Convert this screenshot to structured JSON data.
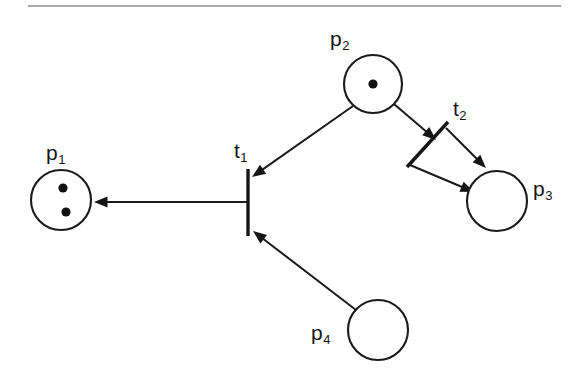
{
  "figure": {
    "width": 577,
    "height": 387,
    "background_color": "#ffffff",
    "ink_color": "#161616",
    "rule_color": "#8e8e8e"
  },
  "top_rule": {
    "name": "top-horizontal-rule",
    "x1": 28,
    "x2": 561,
    "y": 6
  },
  "places": [
    {
      "id": "p1",
      "label_base": "p",
      "label_sub": "1",
      "cx": 61,
      "cy": 200,
      "r": 30,
      "tokens": 2,
      "token_positions": [
        [
          63,
          188
        ],
        [
          66,
          212
        ]
      ],
      "label_x": 46,
      "label_y": 142
    },
    {
      "id": "p2",
      "label_base": "p",
      "label_sub": "2",
      "cx": 373,
      "cy": 84,
      "r": 29,
      "tokens": 1,
      "token_positions": [
        [
          373,
          84
        ]
      ],
      "label_x": 330,
      "label_y": 28
    },
    {
      "id": "p3",
      "label_base": "p",
      "label_sub": "3",
      "cx": 497,
      "cy": 201,
      "r": 30,
      "tokens": 0,
      "token_positions": [],
      "label_x": 533,
      "label_y": 178
    },
    {
      "id": "p4",
      "label_base": "p",
      "label_sub": "4",
      "cx": 378,
      "cy": 330,
      "r": 30,
      "tokens": 0,
      "token_positions": [],
      "label_x": 311,
      "label_y": 322
    }
  ],
  "transitions": [
    {
      "id": "t1",
      "label_base": "t",
      "label_sub": "1",
      "shape": "vertical-bar",
      "x1": 248,
      "y1": 169,
      "x2": 248,
      "y2": 236,
      "label_x": 234,
      "label_y": 140
    },
    {
      "id": "t2",
      "label_base": "t",
      "label_sub": "2",
      "shape": "diagonal-bar",
      "x1": 448,
      "y1": 122,
      "x2": 407,
      "y2": 167,
      "label_x": 453,
      "label_y": 98
    }
  ],
  "arcs": [
    {
      "id": "arc-p2-t1",
      "from": "p2",
      "to": "t1",
      "x1": 353,
      "y1": 106,
      "x2": 252,
      "y2": 177,
      "arrowhead": "end"
    },
    {
      "id": "arc-t1-p1",
      "from": "t1",
      "to": "p1",
      "x1": 247,
      "y1": 202,
      "x2": 94,
      "y2": 202,
      "arrowhead": "end"
    },
    {
      "id": "arc-p4-t1",
      "from": "p4",
      "to": "t1",
      "x1": 356,
      "y1": 310,
      "x2": 253,
      "y2": 231,
      "arrowhead": "end"
    },
    {
      "id": "arc-p2-t2-upper",
      "from": "p2",
      "to": "t2",
      "x1": 394,
      "y1": 104,
      "x2": 436,
      "y2": 140,
      "arrowhead": "end"
    },
    {
      "id": "arc-t2-p3-upper",
      "from": "t2",
      "to": "p3",
      "x1": 446,
      "y1": 128,
      "x2": 486,
      "y2": 168,
      "arrowhead": "end"
    },
    {
      "id": "arc-t2-p3-lower",
      "from": "t2",
      "to": "p3",
      "x1": 410,
      "y1": 165,
      "x2": 474,
      "y2": 192,
      "arrowhead": "end"
    }
  ],
  "legend": {
    "place_description": "circle",
    "transition_description": "bar",
    "token_description": "filled dot"
  }
}
